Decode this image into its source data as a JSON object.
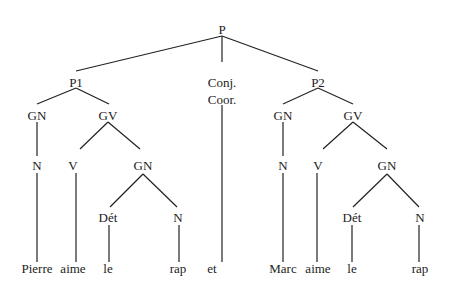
{
  "tree": {
    "nodes": [
      {
        "id": "P",
        "label": "P",
        "x": 222,
        "y": 29
      },
      {
        "id": "P1",
        "label": "P1",
        "x": 76,
        "y": 82
      },
      {
        "id": "CONJ1",
        "label": "Conj.",
        "x": 222,
        "y": 82
      },
      {
        "id": "CONJ2",
        "label": "Coor.",
        "x": 222,
        "y": 99
      },
      {
        "id": "P2",
        "label": "P2",
        "x": 318,
        "y": 82
      },
      {
        "id": "GN1",
        "label": "GN",
        "x": 37,
        "y": 115
      },
      {
        "id": "GV1",
        "label": "GV",
        "x": 108,
        "y": 115
      },
      {
        "id": "N1",
        "label": "N",
        "x": 37,
        "y": 165
      },
      {
        "id": "V1",
        "label": "V",
        "x": 73,
        "y": 165
      },
      {
        "id": "GN2",
        "label": "GN",
        "x": 143,
        "y": 165
      },
      {
        "id": "DET1",
        "label": "Dét",
        "x": 108,
        "y": 217
      },
      {
        "id": "N2",
        "label": "N",
        "x": 178,
        "y": 217
      },
      {
        "id": "GN3",
        "label": "GN",
        "x": 283,
        "y": 115
      },
      {
        "id": "GV2",
        "label": "GV",
        "x": 353,
        "y": 115
      },
      {
        "id": "N3",
        "label": "N",
        "x": 283,
        "y": 165
      },
      {
        "id": "V2",
        "label": "V",
        "x": 318,
        "y": 165
      },
      {
        "id": "GN4",
        "label": "GN",
        "x": 387,
        "y": 165
      },
      {
        "id": "DET2",
        "label": "Dét",
        "x": 352,
        "y": 217
      },
      {
        "id": "N4",
        "label": "N",
        "x": 420,
        "y": 217
      },
      {
        "id": "W1",
        "label": "Pierre",
        "x": 37,
        "y": 268
      },
      {
        "id": "W2",
        "label": "aime",
        "x": 73,
        "y": 268
      },
      {
        "id": "W3",
        "label": "le",
        "x": 108,
        "y": 268
      },
      {
        "id": "W4",
        "label": "rap",
        "x": 178,
        "y": 268
      },
      {
        "id": "W5",
        "label": "et",
        "x": 212,
        "y": 268
      },
      {
        "id": "W6",
        "label": "Marc",
        "x": 283,
        "y": 268
      },
      {
        "id": "W7",
        "label": "aime",
        "x": 318,
        "y": 268
      },
      {
        "id": "W8",
        "label": "le",
        "x": 352,
        "y": 268
      },
      {
        "id": "W9",
        "label": "rap",
        "x": 420,
        "y": 268
      }
    ],
    "edges": [
      [
        222,
        36,
        76,
        71
      ],
      [
        222,
        36,
        222,
        62
      ],
      [
        222,
        36,
        318,
        71
      ],
      [
        76,
        88,
        37,
        104
      ],
      [
        76,
        88,
        109,
        104
      ],
      [
        37,
        122,
        37,
        156
      ],
      [
        37,
        173,
        37,
        262
      ],
      [
        108,
        122,
        80,
        149
      ],
      [
        108,
        122,
        140,
        149
      ],
      [
        76,
        173,
        76,
        262
      ],
      [
        143,
        174,
        110,
        207
      ],
      [
        143,
        174,
        177,
        207
      ],
      [
        109,
        225,
        109,
        262
      ],
      [
        179,
        225,
        179,
        262
      ],
      [
        222,
        105,
        222,
        262
      ],
      [
        318,
        88,
        283,
        104
      ],
      [
        318,
        88,
        353,
        104
      ],
      [
        283,
        122,
        283,
        156
      ],
      [
        283,
        173,
        283,
        262
      ],
      [
        353,
        122,
        323,
        149
      ],
      [
        353,
        122,
        387,
        149
      ],
      [
        317,
        173,
        317,
        262
      ],
      [
        387,
        174,
        353,
        207
      ],
      [
        387,
        174,
        419,
        207
      ],
      [
        352,
        225,
        352,
        262
      ],
      [
        419,
        225,
        419,
        262
      ]
    ],
    "line_color": "#222222"
  }
}
